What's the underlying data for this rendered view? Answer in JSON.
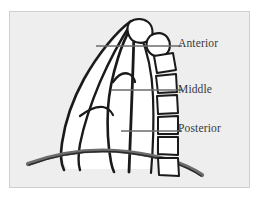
{
  "figure": {
    "kind": "lateral-chest-mediastinum-diagram",
    "background_color": "#eeeeee",
    "frame_border_color": "#cfcfcf",
    "ink_color": "#1a1a1a",
    "leader_line_color": "#6b6b6b",
    "label_text_color": "#38383a",
    "fill_color": "#ffffff"
  },
  "labels": [
    {
      "id": "anterior",
      "text": "Anterior"
    },
    {
      "id": "middle",
      "text": "Middle"
    },
    {
      "id": "posterior",
      "text": "Posterior"
    }
  ],
  "leaders": [
    {
      "id": "anterior-leader",
      "from_x": 86,
      "from_y": 34,
      "to_x": 172,
      "to_y": 34
    },
    {
      "id": "middle-leader",
      "from_x": 101,
      "from_y": 78,
      "to_x": 172,
      "to_y": 78
    },
    {
      "id": "posterior-leader",
      "from_x": 111,
      "from_y": 119,
      "to_x": 172,
      "to_y": 119
    }
  ],
  "compartments": [
    {
      "name": "Anterior",
      "description": "region anterior to the pericardium / ascending aorta"
    },
    {
      "name": "Middle",
      "description": "region of the heart, great vessels and hila"
    },
    {
      "name": "Posterior",
      "description": "region posterior to the pericardium, anterior to vertebral bodies"
    }
  ],
  "anatomy": [
    {
      "name": "thoracic-vertebral-bodies",
      "count": 6
    },
    {
      "name": "apical-vertebrae-tilted",
      "count": 2
    },
    {
      "name": "diaphragm-dome"
    },
    {
      "name": "anterior-chest-wall-outline"
    },
    {
      "name": "mediastinal-border-anterior"
    },
    {
      "name": "mediastinal-border-posterior"
    },
    {
      "name": "cardiac-silhouette-outline"
    }
  ]
}
